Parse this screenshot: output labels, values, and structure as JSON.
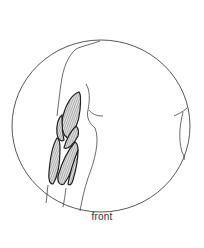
{
  "figure": {
    "view_label": "front",
    "colors": {
      "background": "#ffffff",
      "outline": "#444444",
      "muscle_fill": "#bdbdbd",
      "muscle_stroke": "#222222",
      "label": "#333333"
    }
  }
}
